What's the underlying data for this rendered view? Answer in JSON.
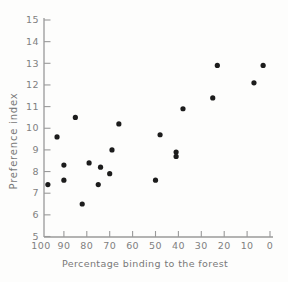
{
  "figure": {
    "background": "#fdfdfc",
    "kind": "scanned scatter plot, no title, no legend, no grid"
  },
  "chart_data": {
    "type": "scatter",
    "title": "",
    "xlabel": "Percentage binding to the forest",
    "ylabel": "Preference index",
    "xlim": [
      100,
      0
    ],
    "ylim": [
      5,
      15
    ],
    "x_axis_reversed": true,
    "grid": false,
    "legend": null,
    "x_ticks": [
      100,
      90,
      80,
      70,
      60,
      50,
      40,
      30,
      20,
      10,
      0
    ],
    "y_ticks": [
      5,
      6,
      7,
      8,
      9,
      10,
      11,
      12,
      13,
      14,
      15
    ],
    "marker": {
      "shape": "circle",
      "color": "#1c1c1c",
      "radius": 2.6
    },
    "axis_color": "#9a9a9a",
    "tick_label_color": "#808080",
    "points": [
      {
        "x": 97,
        "y": 7.4
      },
      {
        "x": 93,
        "y": 9.6
      },
      {
        "x": 90,
        "y": 8.3
      },
      {
        "x": 90,
        "y": 7.6
      },
      {
        "x": 85,
        "y": 10.5
      },
      {
        "x": 82,
        "y": 6.5
      },
      {
        "x": 79,
        "y": 8.4
      },
      {
        "x": 75,
        "y": 7.4
      },
      {
        "x": 74,
        "y": 8.2
      },
      {
        "x": 70,
        "y": 7.9
      },
      {
        "x": 69,
        "y": 9.0
      },
      {
        "x": 66,
        "y": 10.2
      },
      {
        "x": 50,
        "y": 7.6
      },
      {
        "x": 48,
        "y": 9.7
      },
      {
        "x": 41,
        "y": 8.9
      },
      {
        "x": 41,
        "y": 8.7
      },
      {
        "x": 38,
        "y": 10.9
      },
      {
        "x": 25,
        "y": 11.4
      },
      {
        "x": 23,
        "y": 12.9
      },
      {
        "x": 7,
        "y": 12.1
      },
      {
        "x": 3,
        "y": 12.9
      }
    ]
  }
}
